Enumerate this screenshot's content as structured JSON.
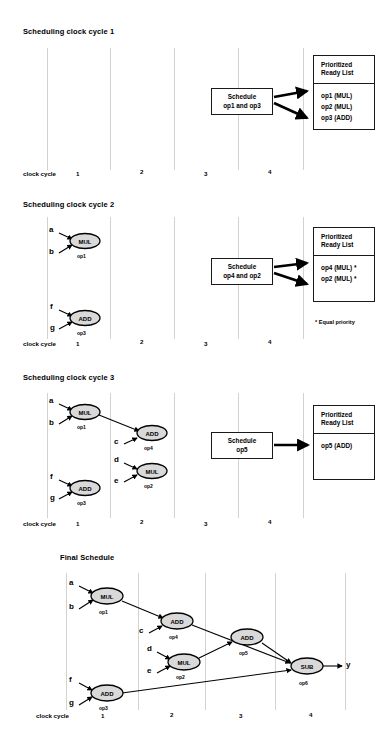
{
  "axis": {
    "label": "clock cycle",
    "ticks": [
      "1",
      "2",
      "3",
      "4"
    ]
  },
  "panels": [
    {
      "title": "Scheduling clock cycle 1",
      "schedule_box": [
        "Schedule",
        "op1 and op3"
      ],
      "ready_list": {
        "header": [
          "Prioritized",
          "Ready List"
        ],
        "items": [
          "op1 (MUL)",
          "op2 (MUL)",
          "op3 (ADD)"
        ]
      },
      "footnote": "",
      "nodes": []
    },
    {
      "title": "Scheduling clock cycle 2",
      "schedule_box": [
        "Schedule",
        "op4 and op2"
      ],
      "ready_list": {
        "header": [
          "Prioritized",
          "Ready List"
        ],
        "items": [
          "op4 (MUL) *",
          "op2 (MUL) *"
        ]
      },
      "footnote": "*  Equal priority",
      "nodes": [
        {
          "op": "MUL",
          "name": "op1",
          "inputs": [
            "a",
            "b"
          ]
        },
        {
          "op": "ADD",
          "name": "op3",
          "inputs": [
            "f",
            "g"
          ]
        }
      ]
    },
    {
      "title": "Scheduling clock cycle 3",
      "schedule_box": [
        "Schedule",
        "op5"
      ],
      "ready_list": {
        "header": [
          "Prioritized",
          "Ready List"
        ],
        "items": [
          "op5 (ADD)"
        ]
      },
      "footnote": "",
      "nodes": [
        {
          "op": "MUL",
          "name": "op1",
          "inputs": [
            "a",
            "b"
          ]
        },
        {
          "op": "ADD",
          "name": "op4",
          "inputs": [
            "c"
          ]
        },
        {
          "op": "MUL",
          "name": "op2",
          "inputs": [
            "d",
            "e"
          ]
        },
        {
          "op": "ADD",
          "name": "op3",
          "inputs": [
            "f",
            "g"
          ]
        }
      ]
    },
    {
      "title": "Final Schedule",
      "schedule_box": [],
      "ready_list": null,
      "footnote": "",
      "output": "y",
      "nodes": [
        {
          "op": "MUL",
          "name": "op1",
          "inputs": [
            "a",
            "b"
          ]
        },
        {
          "op": "ADD",
          "name": "op4",
          "inputs": [
            "c"
          ]
        },
        {
          "op": "MUL",
          "name": "op2",
          "inputs": [
            "d",
            "e"
          ]
        },
        {
          "op": "ADD",
          "name": "op5",
          "inputs": []
        },
        {
          "op": "SUB",
          "name": "op6",
          "inputs": []
        },
        {
          "op": "ADD",
          "name": "op3",
          "inputs": [
            "f",
            "g"
          ]
        }
      ]
    }
  ],
  "colors": {
    "node_fill": "#d9d9d9",
    "node_stroke": "#000000",
    "gridline": "#d2d2d2",
    "box_stroke": "#1a1a1a"
  }
}
